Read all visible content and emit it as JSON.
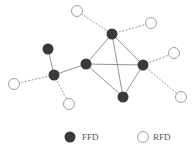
{
  "diagram": {
    "nodes": [
      {
        "id": "f1",
        "type": "FFD",
        "x": 112,
        "y": 34
      },
      {
        "id": "f2",
        "type": "FFD",
        "x": 48,
        "y": 49
      },
      {
        "id": "f3",
        "type": "FFD",
        "x": 86,
        "y": 64
      },
      {
        "id": "f4",
        "type": "FFD",
        "x": 143,
        "y": 65
      },
      {
        "id": "f5",
        "type": "FFD",
        "x": 123,
        "y": 97
      },
      {
        "id": "f6",
        "type": "FFD",
        "x": 54,
        "y": 75
      },
      {
        "id": "r1",
        "type": "RFD",
        "x": 77,
        "y": 11
      },
      {
        "id": "r2",
        "type": "RFD",
        "x": 151,
        "y": 23
      },
      {
        "id": "r3",
        "type": "RFD",
        "x": 174,
        "y": 53
      },
      {
        "id": "r4",
        "type": "RFD",
        "x": 181,
        "y": 97
      },
      {
        "id": "r5",
        "type": "RFD",
        "x": 14,
        "y": 84
      },
      {
        "id": "r6",
        "type": "RFD",
        "x": 69,
        "y": 104
      }
    ],
    "solid_edges": [
      [
        "f1",
        "f3"
      ],
      [
        "f1",
        "f4"
      ],
      [
        "f1",
        "f5"
      ],
      [
        "f3",
        "f4"
      ],
      [
        "f3",
        "f5"
      ],
      [
        "f4",
        "f5"
      ],
      [
        "f3",
        "f6"
      ],
      [
        "f2",
        "f6"
      ]
    ],
    "dashed_edges": [
      [
        "f1",
        "r1"
      ],
      [
        "f1",
        "r2"
      ],
      [
        "f4",
        "r3"
      ],
      [
        "f4",
        "r4"
      ],
      [
        "f6",
        "r5"
      ],
      [
        "f6",
        "r6"
      ]
    ]
  },
  "legend": {
    "ffd_label": "FFD",
    "rfd_label": "RFD"
  },
  "colors": {
    "ffd_fill": "#3a3a3a",
    "rfd_stroke": "#888888",
    "edge": "#777777"
  }
}
